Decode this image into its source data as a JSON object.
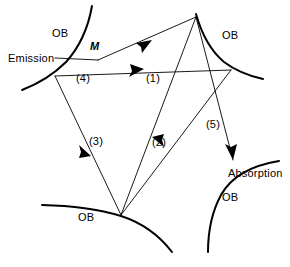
{
  "figure": {
    "type": "ray-diagram",
    "background_color": "#ffffff",
    "line_color": "#000000",
    "width": 290,
    "height": 267,
    "labels": {
      "emission": "Emission",
      "absorption": "Absorption",
      "point_m": "M",
      "boundary_top_left": "OB",
      "boundary_top_right": "OB",
      "boundary_bottom_left": "OB",
      "boundary_bottom_right": "OB"
    },
    "ray_labels": {
      "ray1": "(1)",
      "ray2": "(2)",
      "ray3": "(3)",
      "ray4": "(4)",
      "ray5": "(5)"
    }
  }
}
